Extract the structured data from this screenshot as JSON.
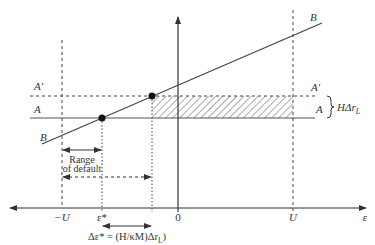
{
  "diagram": {
    "type": "economics-default-range-diagram",
    "axes": {
      "horizontal_label": "ε",
      "origin_label": "0",
      "tick_labels": {
        "minus_U": "−U",
        "epsilon_star": "ε*",
        "zero": "0",
        "U": "U"
      }
    },
    "lines": {
      "A": {
        "left_label": "A",
        "right_label": "A",
        "style": "solid"
      },
      "A_prime": {
        "left_label": "A′",
        "right_label": "A′",
        "style": "dashed"
      },
      "B": {
        "left_label": "B",
        "right_label": "B",
        "style": "solid"
      }
    },
    "annotations": {
      "brace_label": "HΔr",
      "brace_label_sub": "L",
      "range_of_default_line1": "Range",
      "range_of_default_line2": "of default",
      "delta_eq": "Δε* = (H/κM)Δr",
      "delta_eq_sub": "L",
      "delta_eq_close": ")"
    },
    "points": [
      {
        "name": "intersection-B-A",
        "on": "A"
      },
      {
        "name": "intersection-B-Aprime",
        "on": "A′"
      }
    ],
    "colors": {
      "line": "#444444",
      "hatch": "#555555",
      "background": "#ffffff"
    }
  }
}
